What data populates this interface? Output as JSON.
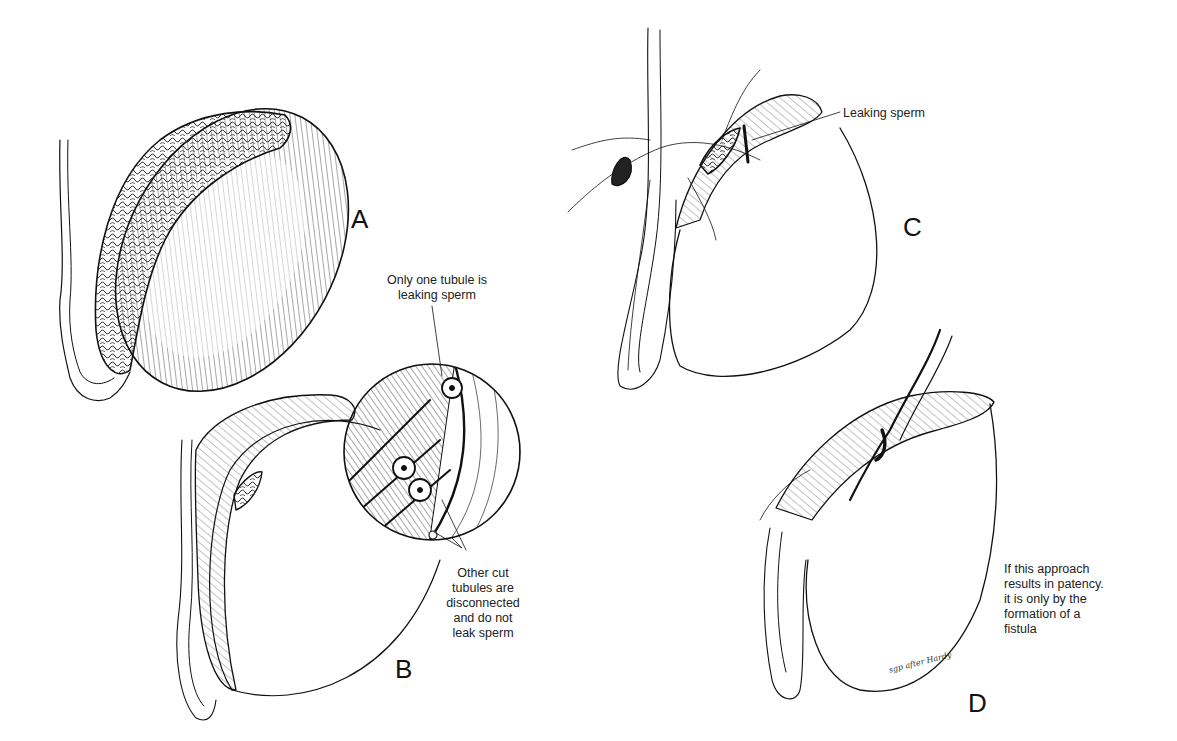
{
  "figure": {
    "panels": [
      {
        "id": "A",
        "label": "A",
        "caption": ""
      },
      {
        "id": "B",
        "label": "B",
        "callout_top": "Only one tubule is\nleaking sperm",
        "callout_bottom": "Other cut\ntubules are\ndisconnected\nand do not\nleak sperm"
      },
      {
        "id": "C",
        "label": "C",
        "callout": "Leaking sperm"
      },
      {
        "id": "D",
        "label": "D",
        "caption": "If this approach\nresults in patency.\nit is only by the\nformation of a\nfistula",
        "signature": "sgp after Hardy"
      }
    ]
  }
}
